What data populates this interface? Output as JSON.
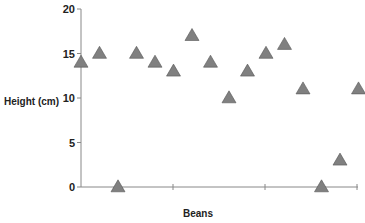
{
  "chart_data": {
    "type": "scatter",
    "title": "",
    "xlabel": "Beans",
    "ylabel": "Height (cm)",
    "ylim": [
      0,
      20
    ],
    "yticks": [
      0,
      5,
      10,
      15,
      20
    ],
    "grid": false,
    "legend": null,
    "marker": "triangle",
    "marker_color": "#808080",
    "marker_edge_color": "#555555",
    "axis_color": "#888888",
    "x": [
      1,
      2,
      3,
      4,
      5,
      6,
      7,
      8,
      9,
      10,
      11,
      12,
      13,
      14,
      15,
      16
    ],
    "values": [
      14,
      15,
      0,
      15,
      14,
      13,
      17,
      14,
      10,
      13,
      15,
      16,
      11,
      0,
      3,
      11
    ]
  }
}
